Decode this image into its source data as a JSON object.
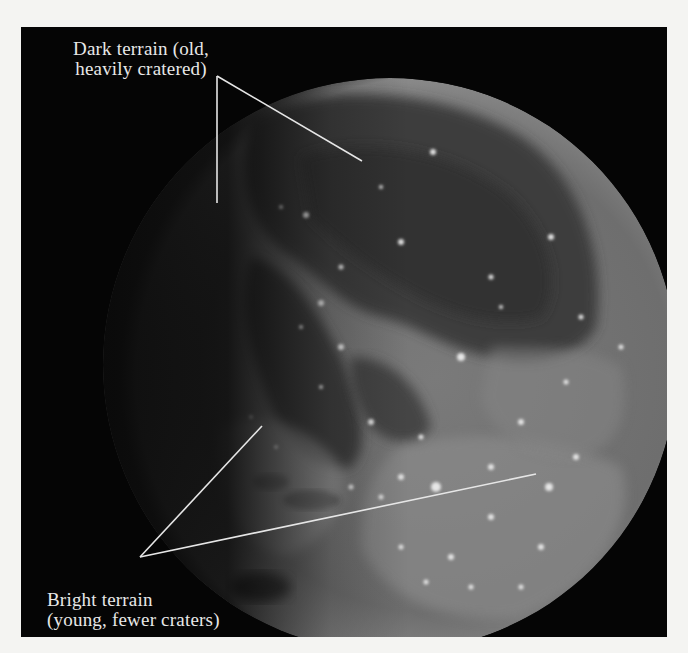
{
  "figure": {
    "background_color": "#050505",
    "page_color": "#f4f4f2",
    "label_color": "#e8e8e8"
  },
  "labels": {
    "dark_terrain": {
      "line1": "Dark terrain (old,",
      "line2": "heavily cratered)"
    },
    "bright_terrain": {
      "line1": "Bright terrain",
      "line2": "(young, fewer craters)"
    }
  }
}
